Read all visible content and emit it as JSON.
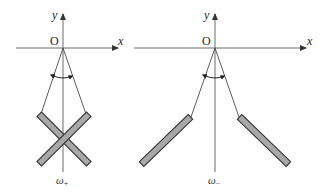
{
  "figure": {
    "panels": [
      {
        "id": "left",
        "origin_label": "O",
        "x_label": "x",
        "y_label": "y",
        "omega_symbol": "ω",
        "omega_sub": "+",
        "configuration": "crossed rods"
      },
      {
        "id": "right",
        "origin_label": "O",
        "x_label": "x",
        "y_label": "y",
        "omega_symbol": "ω",
        "omega_sub": "−",
        "configuration": "splayed rods"
      }
    ],
    "colors": {
      "rod_fill": "#a8a8a8",
      "rod_outline": "#2a2a2a",
      "axis": "#6a6a6a",
      "string": "#4a4a4a"
    }
  }
}
